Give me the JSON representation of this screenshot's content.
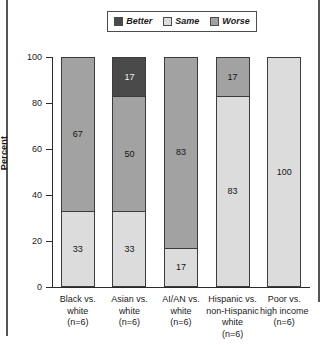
{
  "legend": {
    "items": [
      {
        "label": "Better",
        "color": "#4a4a4a",
        "key": "better"
      },
      {
        "label": "Same",
        "color": "#dcdcdc",
        "key": "same"
      },
      {
        "label": "Worse",
        "color": "#a2a2a2",
        "key": "worse"
      }
    ]
  },
  "axis": {
    "y_title": "Percent",
    "y_ticks": [
      "100",
      "80",
      "60",
      "40",
      "20",
      "0"
    ]
  },
  "chart_data": {
    "type": "bar",
    "title": "",
    "subtitle": "",
    "xlabel": "",
    "ylabel": "Percent",
    "ylim": [
      0,
      100
    ],
    "grid": false,
    "stacked": true,
    "stack_total": 100,
    "legend_position": "top",
    "legend_entries": [
      "Better",
      "Same",
      "Worse"
    ],
    "categories": [
      "Black vs.\nwhite\n(n=6)",
      "Asian vs.\nwhite\n(n=6)",
      "AI/AN vs.\nwhite\n(n=6)",
      "Hispanic vs.\nnon-Hispanic\nwhite\n(n=6)",
      "Poor vs.\nhigh income\n(n=6)"
    ],
    "series": [
      {
        "name": "Better",
        "color": "#4a4a4a",
        "values": [
          0,
          17,
          0,
          0,
          0
        ]
      },
      {
        "name": "Same",
        "color": "#dcdcdc",
        "values": [
          33,
          33,
          17,
          83,
          100
        ]
      },
      {
        "name": "Worse",
        "color": "#a2a2a2",
        "values": [
          67,
          50,
          83,
          17,
          0
        ]
      }
    ],
    "bars": [
      {
        "category": "Black vs.\nwhite\n(n=6)",
        "segments": [
          {
            "series": "Worse",
            "value": 67,
            "label": "67",
            "color": "#a2a2a2"
          },
          {
            "series": "Same",
            "value": 33,
            "label": "33",
            "color": "#dcdcdc"
          }
        ]
      },
      {
        "category": "Asian vs.\nwhite\n(n=6)",
        "segments": [
          {
            "series": "Better",
            "value": 17,
            "label": "17",
            "color": "#4a4a4a"
          },
          {
            "series": "Worse",
            "value": 50,
            "label": "50",
            "color": "#a2a2a2"
          },
          {
            "series": "Same",
            "value": 33,
            "label": "33",
            "color": "#dcdcdc"
          }
        ]
      },
      {
        "category": "AI/AN vs.\nwhite\n(n=6)",
        "segments": [
          {
            "series": "Worse",
            "value": 83,
            "label": "83",
            "color": "#a2a2a2"
          },
          {
            "series": "Same",
            "value": 17,
            "label": "17",
            "color": "#dcdcdc"
          }
        ]
      },
      {
        "category": "Hispanic vs.\nnon-Hispanic\nwhite\n(n=6)",
        "segments": [
          {
            "series": "Worse",
            "value": 17,
            "label": "17",
            "color": "#a2a2a2"
          },
          {
            "series": "Same",
            "value": 83,
            "label": "83",
            "color": "#dcdcdc"
          }
        ]
      },
      {
        "category": "Poor vs.\nhigh income\n(n=6)",
        "segments": [
          {
            "series": "Same",
            "value": 100,
            "label": "100",
            "color": "#dcdcdc"
          }
        ]
      }
    ]
  }
}
